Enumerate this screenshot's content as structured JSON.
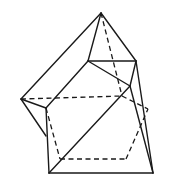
{
  "figure": {
    "type": "polyhedron-line-drawing",
    "stroke_color": "#1a1a1a",
    "background": "#ffffff",
    "vertices": {
      "A": [
        101,
        13
      ],
      "L": [
        21,
        99
      ],
      "Q": [
        46,
        108
      ],
      "R": [
        46,
        136
      ],
      "UL": [
        88,
        61
      ],
      "UR": [
        136,
        61
      ],
      "P": [
        130,
        86
      ],
      "BL": [
        49,
        173
      ],
      "BR": [
        153,
        173
      ],
      "H": [
        122,
        96
      ],
      "E": [
        148,
        109
      ],
      "D1": [
        60,
        159
      ],
      "D2": [
        126,
        159
      ]
    },
    "solid_edges": [
      [
        "A",
        "L"
      ],
      [
        "A",
        "UL"
      ],
      [
        "A",
        "UR"
      ],
      [
        "UL",
        "UR"
      ],
      [
        "UL",
        "P"
      ],
      [
        "UR",
        "P"
      ],
      [
        "UR",
        "BR"
      ],
      [
        "L",
        "Q"
      ],
      [
        "L",
        "R"
      ],
      [
        "Q",
        "UL"
      ],
      [
        "Q",
        "BL"
      ],
      [
        "BL",
        "BR"
      ],
      [
        "BL",
        "P"
      ],
      [
        "P",
        "BR"
      ]
    ],
    "dashed_edges": [
      [
        "A",
        "H"
      ],
      [
        "L",
        "H"
      ],
      [
        "H",
        "E"
      ],
      [
        "Q",
        "D1"
      ],
      [
        "D1",
        "D2"
      ],
      [
        "D2",
        "E"
      ]
    ]
  }
}
